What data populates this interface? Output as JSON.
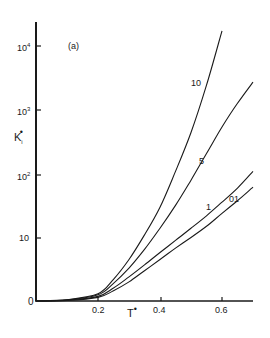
{
  "chart_data": {
    "type": "line",
    "title": "",
    "panel_label": "(a)",
    "xlabel": "T*",
    "ylabel": "K_i*",
    "x_scale": "linear",
    "y_scale": "log",
    "xlim": [
      0,
      0.7
    ],
    "ylim": [
      1,
      30000
    ],
    "x_ticks": [
      {
        "value": 0.2,
        "label": "0.2"
      },
      {
        "value": 0.4,
        "label": "0.4"
      },
      {
        "value": 0.6,
        "label": "0.6"
      }
    ],
    "y_ticks": [
      {
        "value": 1,
        "label": "0"
      },
      {
        "value": 10,
        "label": "10"
      },
      {
        "value": 100,
        "label": "10²"
      },
      {
        "value": 1000,
        "label": "10³"
      },
      {
        "value": 10000,
        "label": "10⁴"
      }
    ],
    "grid": false,
    "legend": "inline curve labels",
    "series": [
      {
        "name": "10",
        "x": [
          0.0,
          0.1,
          0.2,
          0.25,
          0.3,
          0.35,
          0.4,
          0.45,
          0.5,
          0.55,
          0.6
        ],
        "values": [
          1.0,
          1.05,
          1.3,
          2.2,
          4.5,
          11,
          30,
          110,
          450,
          2500,
          18000
        ]
      },
      {
        "name": "5",
        "x": [
          0.0,
          0.1,
          0.2,
          0.25,
          0.3,
          0.35,
          0.4,
          0.45,
          0.5,
          0.55,
          0.6,
          0.65,
          0.7
        ],
        "values": [
          1.0,
          1.04,
          1.25,
          1.9,
          3.3,
          6.5,
          14,
          32,
          80,
          210,
          550,
          1300,
          2800
        ]
      },
      {
        "name": "1",
        "x": [
          0.0,
          0.1,
          0.2,
          0.25,
          0.3,
          0.35,
          0.4,
          0.45,
          0.5,
          0.55,
          0.6,
          0.65,
          0.7
        ],
        "values": [
          1.0,
          1.03,
          1.18,
          1.6,
          2.4,
          3.7,
          5.8,
          9,
          14,
          22,
          36,
          60,
          110
        ]
      },
      {
        "name": "0.1",
        "x": [
          0.0,
          0.1,
          0.2,
          0.25,
          0.3,
          0.35,
          0.4,
          0.45,
          0.5,
          0.55,
          0.6,
          0.65,
          0.7
        ],
        "values": [
          1.0,
          1.02,
          1.14,
          1.45,
          2.0,
          3.0,
          4.5,
          6.8,
          10,
          15,
          24,
          38,
          62
        ]
      }
    ],
    "annotations": [
      {
        "text": "10",
        "near_series": "10"
      },
      {
        "text": "5",
        "near_series": "5"
      },
      {
        "text": "1",
        "near_series": "1"
      },
      {
        "text": "0.1",
        "near_series": "0.1"
      }
    ]
  },
  "labels": {
    "panel": "(a)",
    "y_axis_main": "K",
    "y_axis_sub": "i",
    "y_axis_sup": "•",
    "x_axis_main": "T",
    "x_axis_sup": "•",
    "ytick_1e4_base": "10",
    "ytick_1e4_exp": "4",
    "ytick_1e3_base": "10",
    "ytick_1e3_exp": "3",
    "ytick_1e2_base": "10",
    "ytick_1e2_exp": "2",
    "ytick_10": "10",
    "ytick_0": "0",
    "xtick_02": "0.2",
    "xtick_04": "0.4",
    "xtick_06": "0.6",
    "curve_10": "10",
    "curve_5": "5",
    "curve_1": "1",
    "curve_01": "01"
  }
}
